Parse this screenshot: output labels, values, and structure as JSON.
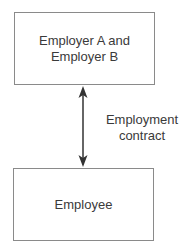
{
  "diagram": {
    "top_box": {
      "line1": "Employer A and",
      "line2": "Employer B"
    },
    "bottom_box": {
      "text": "Employee"
    },
    "connector": {
      "label_line1": "Employment",
      "label_line2": "contract",
      "type": "double-headed-arrow"
    },
    "colors": {
      "stroke": "#8a8a8a",
      "arrow": "#333333",
      "text": "#3a3a3a"
    }
  }
}
